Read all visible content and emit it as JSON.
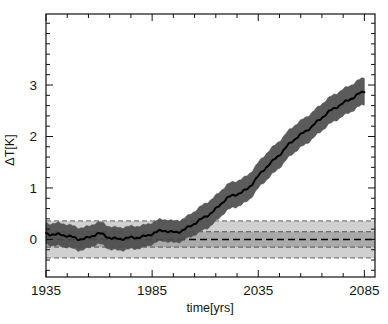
{
  "chart_data": {
    "type": "line",
    "title": "",
    "xlabel": "time[yrs]",
    "ylabel": "ΔT[K]",
    "xlim": [
      1935,
      2090
    ],
    "ylim": [
      -0.73,
      4.38
    ],
    "xticks": [
      1935,
      1985,
      2035,
      2085
    ],
    "xtick_labels": [
      "1935",
      "1985",
      "2035",
      "2085"
    ],
    "yticks": [
      0,
      1,
      2,
      3
    ],
    "ytick_labels": [
      "0",
      "1",
      "2",
      "3"
    ],
    "x_minor_tick_interval": 10,
    "y_minor_tick_interval": 0.2,
    "grid": false,
    "legend": null,
    "series": [
      {
        "name": "projected temperature anomaly",
        "style": "solid black line with dark grey uncertainty band",
        "line_color": "#000000",
        "band_color": "#4d4d4d",
        "x": [
          1935,
          1940,
          1945,
          1950,
          1955,
          1960,
          1965,
          1970,
          1975,
          1980,
          1985,
          1990,
          1995,
          2000,
          2005,
          2010,
          2015,
          2020,
          2025,
          2030,
          2035,
          2040,
          2045,
          2050,
          2055,
          2060,
          2065,
          2070,
          2075,
          2080,
          2085
        ],
        "values": [
          0.12,
          0.1,
          0.06,
          0.02,
          0.04,
          0.1,
          0.04,
          0.02,
          0.02,
          0.05,
          0.12,
          0.16,
          0.14,
          0.2,
          0.3,
          0.44,
          0.6,
          0.78,
          0.88,
          1.0,
          1.22,
          1.45,
          1.66,
          1.86,
          2.03,
          2.2,
          2.36,
          2.52,
          2.66,
          2.76,
          2.86
        ],
        "band_lower": [
          -0.08,
          -0.12,
          -0.16,
          -0.2,
          -0.16,
          -0.1,
          -0.18,
          -0.2,
          -0.2,
          -0.16,
          -0.08,
          -0.04,
          -0.06,
          0.0,
          0.08,
          0.2,
          0.36,
          0.54,
          0.64,
          0.76,
          0.98,
          1.2,
          1.41,
          1.61,
          1.78,
          1.95,
          2.11,
          2.27,
          2.41,
          2.51,
          2.61
        ],
        "band_upper": [
          0.32,
          0.32,
          0.28,
          0.24,
          0.26,
          0.32,
          0.26,
          0.24,
          0.24,
          0.27,
          0.34,
          0.38,
          0.36,
          0.42,
          0.54,
          0.7,
          0.86,
          1.04,
          1.14,
          1.26,
          1.48,
          1.72,
          1.93,
          2.13,
          2.3,
          2.47,
          2.63,
          2.79,
          2.93,
          3.03,
          3.13
        ]
      }
    ],
    "reference_bands": [
      {
        "name": "outer natural variability band",
        "style": "light grey shaded band with dashed edges",
        "color": "#c8c8c8",
        "lower": -0.36,
        "upper": 0.36
      },
      {
        "name": "inner natural variability band",
        "style": "medium grey shaded band with dashed edges",
        "color": "#a8a8a8",
        "lower": -0.15,
        "upper": 0.15
      },
      {
        "name": "reference mean line",
        "style": "black dashed horizontal line",
        "color": "#000000",
        "value": 0.0
      }
    ]
  }
}
